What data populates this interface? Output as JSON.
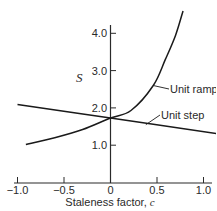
{
  "chart_data": {
    "type": "line",
    "title": "",
    "xlabel": "Staleness factor, c",
    "xlabel_text": "Staleness factor, ",
    "xlabel_var": "c",
    "ylabel": "S",
    "xlim": [
      -1.05,
      1.12
    ],
    "ylim": [
      0,
      4.6
    ],
    "grid": false,
    "legend": "inline labels",
    "x_ticks": [
      -1.0,
      -0.5,
      0,
      0.5,
      1.0
    ],
    "x_tick_labels": [
      "−1.0",
      "−0.5",
      "0",
      "0.5",
      "1.0"
    ],
    "y_ticks": [
      1.0,
      2.0,
      3.0,
      4.0
    ],
    "y_tick_labels": [
      "1.0",
      "2.0",
      "3.0",
      "4.0"
    ],
    "series": [
      {
        "name": "Unit ramp",
        "x": [
          -0.91,
          -0.6,
          -0.3,
          0.0,
          0.22,
          0.46,
          0.59,
          0.7,
          0.78
        ],
        "values": [
          1.02,
          1.2,
          1.42,
          1.73,
          1.93,
          2.6,
          3.3,
          3.95,
          4.6
        ]
      },
      {
        "name": "Unit step",
        "x": [
          -1.0,
          0.0,
          1.14
        ],
        "values": [
          2.09,
          1.73,
          1.31
        ]
      }
    ],
    "annotations": [
      {
        "text": "Unit ramp",
        "points_to": [
          0.46,
          2.6
        ]
      },
      {
        "text": "Unit step",
        "points_to": [
          0.38,
          1.55
        ]
      }
    ]
  }
}
